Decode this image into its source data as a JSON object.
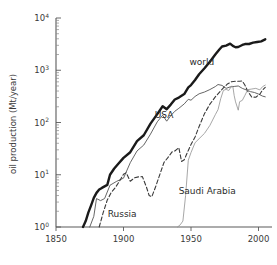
{
  "chart_data": {
    "type": "line",
    "title": "",
    "xlabel": "",
    "ylabel": "oil production (Mt/year)",
    "yscale": "log",
    "xlim": [
      1850,
      2010
    ],
    "ylim": [
      1,
      10000
    ],
    "xticks": [
      1850,
      1900,
      1950,
      2000
    ],
    "xtick_labels": [
      "1850",
      "1900",
      "1950",
      "2000"
    ],
    "yticks": [
      1,
      10,
      100,
      1000,
      10000
    ],
    "ytick_labels": [
      "10",
      "10",
      "10",
      "10",
      "10"
    ],
    "ytick_exponents": [
      "0",
      "1",
      "2",
      "3",
      "4"
    ],
    "grid": false,
    "legend": "inline-labels",
    "series": [
      {
        "name": "world",
        "label": "world",
        "style": "solid-thick",
        "color": "#1a1a1a",
        "label_x": 1958,
        "label_y": 1250,
        "points": [
          [
            1870,
            1.0
          ],
          [
            1872,
            1.3
          ],
          [
            1874,
            1.9
          ],
          [
            1876,
            2.6
          ],
          [
            1878,
            3.6
          ],
          [
            1880,
            4.5
          ],
          [
            1882,
            5.2
          ],
          [
            1884,
            5.6
          ],
          [
            1886,
            6.0
          ],
          [
            1888,
            6.4
          ],
          [
            1890,
            10.0
          ],
          [
            1893,
            13.0
          ],
          [
            1896,
            16.0
          ],
          [
            1900,
            21.0
          ],
          [
            1905,
            27.0
          ],
          [
            1910,
            44.0
          ],
          [
            1915,
            57.0
          ],
          [
            1920,
            95.0
          ],
          [
            1925,
            145.0
          ],
          [
            1929,
            205.0
          ],
          [
            1932,
            180.0
          ],
          [
            1935,
            220.0
          ],
          [
            1938,
            275.0
          ],
          [
            1941,
            300.0
          ],
          [
            1945,
            350.0
          ],
          [
            1948,
            470.0
          ],
          [
            1950,
            520.0
          ],
          [
            1953,
            650.0
          ],
          [
            1956,
            840.0
          ],
          [
            1960,
            1090.0
          ],
          [
            1964,
            1460.0
          ],
          [
            1968,
            2000.0
          ],
          [
            1971,
            2490.0
          ],
          [
            1973,
            2850.0
          ],
          [
            1976,
            2970.0
          ],
          [
            1979,
            3230.0
          ],
          [
            1981,
            2920.0
          ],
          [
            1983,
            2760.0
          ],
          [
            1985,
            2790.0
          ],
          [
            1988,
            3050.0
          ],
          [
            1990,
            3170.0
          ],
          [
            1993,
            3180.0
          ],
          [
            1996,
            3370.0
          ],
          [
            1999,
            3470.0
          ],
          [
            2002,
            3580.0
          ],
          [
            2005,
            3900.0
          ]
        ]
      },
      {
        "name": "usa",
        "label": "USA",
        "style": "solid-thin",
        "color": "#555555",
        "label_x": 1930,
        "label_y": 120,
        "points": [
          [
            1875,
            1.0
          ],
          [
            1878,
            1.6
          ],
          [
            1880,
            3.5
          ],
          [
            1883,
            3.2
          ],
          [
            1886,
            3.5
          ],
          [
            1890,
            6.3
          ],
          [
            1895,
            7.5
          ],
          [
            1900,
            8.6
          ],
          [
            1905,
            17.0
          ],
          [
            1910,
            28.5
          ],
          [
            1915,
            37.0
          ],
          [
            1920,
            60.0
          ],
          [
            1925,
            103.0
          ],
          [
            1929,
            138.0
          ],
          [
            1932,
            106.0
          ],
          [
            1935,
            135.0
          ],
          [
            1938,
            164.0
          ],
          [
            1941,
            187.0
          ],
          [
            1945,
            227.0
          ],
          [
            1948,
            278.0
          ],
          [
            1950,
            267.0
          ],
          [
            1953,
            315.0
          ],
          [
            1956,
            354.0
          ],
          [
            1960,
            383.0
          ],
          [
            1964,
            427.0
          ],
          [
            1968,
            487.0
          ],
          [
            1970,
            533.0
          ],
          [
            1973,
            513.0
          ],
          [
            1976,
            450.0
          ],
          [
            1979,
            480.0
          ],
          [
            1982,
            490.0
          ],
          [
            1985,
            500.0
          ],
          [
            1988,
            450.0
          ],
          [
            1991,
            420.0
          ],
          [
            1994,
            390.0
          ],
          [
            1997,
            375.0
          ],
          [
            2000,
            350.0
          ],
          [
            2003,
            320.0
          ],
          [
            2005,
            310.0
          ]
        ]
      },
      {
        "name": "russia",
        "label": "Russia",
        "style": "dashed",
        "color": "#3a3a3a",
        "label_x": 1899,
        "label_y": 1.55,
        "points": [
          [
            1882,
            1.0
          ],
          [
            1885,
            1.9
          ],
          [
            1888,
            3.3
          ],
          [
            1891,
            4.6
          ],
          [
            1894,
            5.7
          ],
          [
            1897,
            7.5
          ],
          [
            1900,
            10.2
          ],
          [
            1902,
            10.9
          ],
          [
            1905,
            7.5
          ],
          [
            1908,
            8.7
          ],
          [
            1911,
            9.1
          ],
          [
            1914,
            9.2
          ],
          [
            1917,
            5.8
          ],
          [
            1919,
            4.0
          ],
          [
            1921,
            3.8
          ],
          [
            1924,
            6.1
          ],
          [
            1927,
            10.3
          ],
          [
            1930,
            17.2
          ],
          [
            1933,
            21.5
          ],
          [
            1936,
            27.4
          ],
          [
            1938,
            28.5
          ],
          [
            1941,
            33.0
          ],
          [
            1943,
            18.0
          ],
          [
            1945,
            19.4
          ],
          [
            1948,
            29.2
          ],
          [
            1950,
            37.9
          ],
          [
            1953,
            52.8
          ],
          [
            1956,
            83.8
          ],
          [
            1960,
            148.0
          ],
          [
            1964,
            224.0
          ],
          [
            1968,
            309.0
          ],
          [
            1971,
            377.0
          ],
          [
            1974,
            459.0
          ],
          [
            1977,
            546.0
          ],
          [
            1980,
            603.0
          ],
          [
            1983,
            616.0
          ],
          [
            1986,
            615.0
          ],
          [
            1988,
            624.0
          ],
          [
            1990,
            516.0
          ],
          [
            1992,
            396.0
          ],
          [
            1995,
            307.0
          ],
          [
            1998,
            304.0
          ],
          [
            2001,
            348.0
          ],
          [
            2003,
            421.0
          ],
          [
            2005,
            470.0
          ]
        ]
      },
      {
        "name": "saudi_arabia",
        "label": "Saudi Arabia",
        "style": "solid-light",
        "color": "#909090",
        "label_x": 1962,
        "label_y": 4.2,
        "points": [
          [
            1940,
            1.0
          ],
          [
            1942,
            1.1
          ],
          [
            1944,
            1.3
          ],
          [
            1946,
            4.0
          ],
          [
            1948,
            19.0
          ],
          [
            1950,
            26.6
          ],
          [
            1953,
            41.0
          ],
          [
            1956,
            49.0
          ],
          [
            1960,
            62.0
          ],
          [
            1964,
            88.0
          ],
          [
            1968,
            141.0
          ],
          [
            1970,
            176.0
          ],
          [
            1972,
            285.0
          ],
          [
            1974,
            412.0
          ],
          [
            1976,
            430.0
          ],
          [
            1978,
            410.0
          ],
          [
            1980,
            496.0
          ],
          [
            1981,
            490.0
          ],
          [
            1982,
            327.0
          ],
          [
            1983,
            248.0
          ],
          [
            1985,
            172.0
          ],
          [
            1986,
            250.0
          ],
          [
            1988,
            265.0
          ],
          [
            1990,
            333.0
          ],
          [
            1992,
            425.0
          ],
          [
            1995,
            437.0
          ],
          [
            1998,
            450.0
          ],
          [
            2001,
            421.0
          ],
          [
            2003,
            485.0
          ],
          [
            2005,
            520.0
          ]
        ]
      }
    ]
  }
}
